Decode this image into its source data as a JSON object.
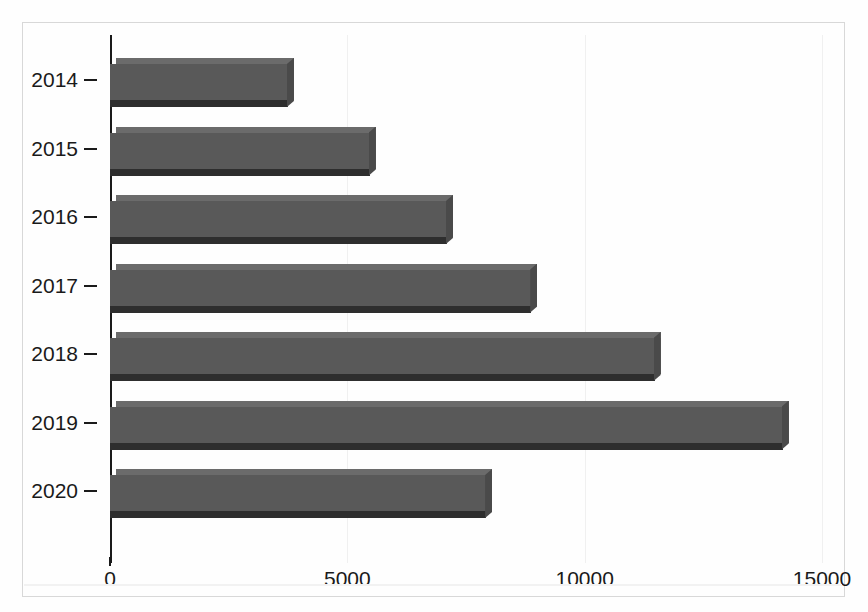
{
  "chart_data": {
    "type": "bar",
    "orientation": "horizontal",
    "title": "",
    "subtitle": "",
    "xlabel": "",
    "ylabel": "",
    "categories": [
      "2014",
      "2015",
      "2016",
      "2017",
      "2018",
      "2019",
      "2020"
    ],
    "values": [
      3875,
      5600,
      7225,
      9000,
      11600,
      14300,
      8050
    ],
    "series": [
      {
        "name": "",
        "values": [
          3875,
          5600,
          7225,
          9000,
          11600,
          14300,
          8050
        ]
      }
    ],
    "xlim": [
      0,
      15000
    ],
    "xticks": [
      0,
      5000,
      10000,
      15000
    ],
    "xtick_labels": [
      "0",
      "5000",
      "10000",
      "15000"
    ],
    "ytick_labels": [
      "2014",
      "2015",
      "2016",
      "2017",
      "2018",
      "2019",
      "2020"
    ],
    "grid": true,
    "grid_axis": "x",
    "legend": false,
    "legend_position": "none",
    "annotations": [],
    "style": "3d-bar",
    "colors": {
      "bar_face": "#595959",
      "bar_top": "#6b6b6b",
      "bar_shadow": "#2e2e2e",
      "bar_side": "#4a4a4a",
      "axis": "#1a1a1a",
      "grid": "#f0f0f0",
      "frame": "#d8d8d8",
      "background": "#fefefe",
      "text": "#1a1a1a"
    }
  },
  "axes": {
    "x": {
      "ticks": [
        {
          "label": "0",
          "value": 0
        },
        {
          "label": "5000",
          "value": 5000
        },
        {
          "label": "10000",
          "value": 10000
        },
        {
          "label": "15000",
          "value": 15000
        }
      ]
    },
    "y": {
      "ticks": [
        {
          "label": "2014"
        },
        {
          "label": "2015"
        },
        {
          "label": "2016"
        },
        {
          "label": "2017"
        },
        {
          "label": "2018"
        },
        {
          "label": "2019"
        },
        {
          "label": "2020"
        }
      ]
    }
  }
}
